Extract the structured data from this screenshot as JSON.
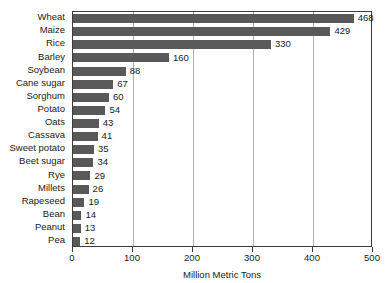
{
  "chart_data": {
    "type": "bar",
    "orientation": "horizontal",
    "title": "",
    "xlabel": "Million Metric Tons",
    "ylabel": "",
    "xlim": [
      0,
      500
    ],
    "xticks": [
      0,
      100,
      200,
      300,
      400,
      500
    ],
    "grid": true,
    "legend": null,
    "bar_color": "#595959",
    "background_color": "#ffffff",
    "gridline_color": "#b0b0b0",
    "axis_color": "#3c3c3c",
    "categories": [
      "Wheat",
      "Maize",
      "Rice",
      "Barley",
      "Soybean",
      "Cane sugar",
      "Sorghum",
      "Potato",
      "Oats",
      "Cassava",
      "Sweet potato",
      "Beet sugar",
      "Rye",
      "Millets",
      "Rapeseed",
      "Bean",
      "Peanut",
      "Pea"
    ],
    "values": [
      468,
      429,
      330,
      160,
      88,
      67,
      60,
      54,
      43,
      41,
      35,
      34,
      29,
      26,
      19,
      14,
      13,
      12
    ],
    "value_labels": [
      "468",
      "429",
      "330",
      "160",
      "88",
      "67",
      "60",
      "54",
      "43",
      "41",
      "35",
      "34",
      "29",
      "26",
      "19",
      "14",
      "13",
      "12"
    ],
    "tick_labels": [
      "0",
      "100",
      "200",
      "300",
      "400",
      "500"
    ]
  }
}
